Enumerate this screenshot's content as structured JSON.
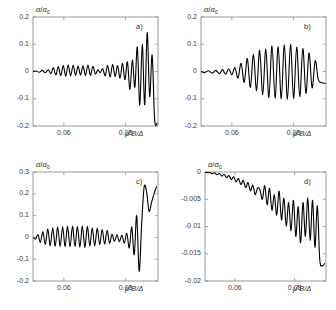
{
  "figure": {
    "title": "",
    "background": "#ffffff",
    "curve_color": "#000000",
    "axis_color": "#808080",
    "text_color": "#2b2b2b"
  },
  "chart_data": [
    {
      "type": "line",
      "panel": "a)",
      "title": "",
      "xlabel": "μ*B/Δ",
      "ylabel": "α/α0",
      "xlim": [
        0.05,
        0.0905
      ],
      "ylim": [
        -0.2,
        0.2
      ],
      "xticks": [
        0.06,
        0.08
      ],
      "xticklabels": [
        "0.06",
        "0.08"
      ],
      "yticks": [
        -0.2,
        -0.1,
        0,
        0.1,
        0.2
      ],
      "yticklabels": [
        "-0.2",
        "-0.1",
        "0",
        "0.1",
        "0.2"
      ],
      "grid": false,
      "legend": "none",
      "x": [
        0.05,
        0.051,
        0.052,
        0.053,
        0.054,
        0.055,
        0.0558,
        0.0566,
        0.0574,
        0.0582,
        0.059,
        0.0598,
        0.0606,
        0.0614,
        0.0622,
        0.063,
        0.0638,
        0.0646,
        0.0654,
        0.0662,
        0.067,
        0.0678,
        0.0686,
        0.0694,
        0.0702,
        0.071,
        0.0718,
        0.0726,
        0.0734,
        0.0742,
        0.075,
        0.0758,
        0.0766,
        0.0774,
        0.0782,
        0.079,
        0.0798,
        0.0806,
        0.0814,
        0.0822,
        0.083,
        0.0838,
        0.0846,
        0.0854,
        0.0862,
        0.087,
        0.0878,
        0.0886,
        0.0894,
        0.0902
      ],
      "y": [
        0.0,
        0.002,
        -0.003,
        0.004,
        -0.004,
        0.006,
        -0.008,
        0.014,
        -0.013,
        0.018,
        -0.015,
        0.022,
        -0.017,
        0.024,
        -0.016,
        0.023,
        -0.014,
        0.02,
        -0.013,
        0.021,
        -0.015,
        0.024,
        -0.014,
        0.019,
        -0.009,
        0.006,
        -0.004,
        0.01,
        -0.016,
        0.022,
        -0.02,
        0.026,
        -0.018,
        0.022,
        -0.024,
        0.03,
        -0.03,
        0.035,
        -0.066,
        0.042,
        -0.058,
        0.09,
        -0.124,
        0.1,
        -0.122,
        0.142,
        -0.092,
        0.06,
        -0.175,
        -0.19
      ]
    },
    {
      "type": "line",
      "panel": "b)",
      "title": "",
      "xlabel": "μ*B/Δ",
      "ylabel": "α/α0",
      "xlim": [
        0.05,
        0.0905
      ],
      "ylim": [
        -0.2,
        0.2
      ],
      "xticks": [
        0.06,
        0.08
      ],
      "xticklabels": [
        "0.06",
        "0.08"
      ],
      "yticks": [
        -0.2,
        -0.1,
        0,
        0.1,
        0.2
      ],
      "yticklabels": [
        "-0.2",
        "-0.1",
        "0",
        "0.1",
        "0.2"
      ],
      "grid": false,
      "legend": "none",
      "x": [
        0.05,
        0.0512,
        0.0524,
        0.0536,
        0.0548,
        0.056,
        0.057,
        0.058,
        0.059,
        0.06,
        0.061,
        0.062,
        0.063,
        0.064,
        0.065,
        0.066,
        0.067,
        0.068,
        0.069,
        0.07,
        0.071,
        0.072,
        0.073,
        0.074,
        0.075,
        0.076,
        0.077,
        0.078,
        0.079,
        0.08,
        0.081,
        0.082,
        0.083,
        0.084,
        0.085,
        0.086,
        0.087,
        0.088,
        0.089,
        0.0902
      ],
      "y": [
        0.0,
        -0.004,
        0.003,
        -0.006,
        0.004,
        -0.008,
        0.007,
        -0.01,
        0.01,
        -0.012,
        0.014,
        -0.024,
        0.03,
        -0.04,
        0.048,
        -0.058,
        0.062,
        -0.07,
        0.078,
        -0.085,
        0.082,
        -0.095,
        0.094,
        -0.098,
        0.092,
        -0.1,
        0.098,
        -0.102,
        0.1,
        -0.098,
        0.09,
        -0.092,
        0.084,
        -0.08,
        0.068,
        -0.06,
        0.04,
        -0.03,
        -0.04,
        -0.044
      ]
    },
    {
      "type": "line",
      "panel": "c)",
      "title": "",
      "xlabel": "μ*B/Δ",
      "ylabel": "α/α0",
      "xlim": [
        0.05,
        0.0905
      ],
      "ylim": [
        -0.2,
        0.3
      ],
      "xticks": [
        0.06,
        0.08
      ],
      "xticklabels": [
        "0.06",
        "0.08"
      ],
      "yticks": [
        -0.2,
        -0.1,
        0,
        0.1,
        0.2,
        0.3
      ],
      "yticklabels": [
        "-0.2",
        "-0.1",
        "0",
        "0.1",
        "0.2",
        "0.3"
      ],
      "grid": false,
      "legend": "none",
      "x": [
        0.05,
        0.0508,
        0.0516,
        0.0524,
        0.0532,
        0.054,
        0.0548,
        0.0556,
        0.0564,
        0.0572,
        0.058,
        0.0588,
        0.0596,
        0.0604,
        0.0612,
        0.062,
        0.0628,
        0.0636,
        0.0644,
        0.0652,
        0.066,
        0.0668,
        0.0676,
        0.0684,
        0.0692,
        0.07,
        0.0708,
        0.0716,
        0.0724,
        0.0732,
        0.074,
        0.0748,
        0.0756,
        0.0764,
        0.0772,
        0.078,
        0.0788,
        0.0796,
        0.0804,
        0.0812,
        0.082,
        0.0828,
        0.0836,
        0.0844,
        0.0852,
        0.086,
        0.0868,
        0.0876,
        0.0884,
        0.0892,
        0.09
      ],
      "y": [
        0.0,
        -0.008,
        0.012,
        -0.022,
        0.026,
        -0.032,
        0.038,
        -0.038,
        0.044,
        -0.04,
        0.048,
        -0.042,
        0.05,
        -0.042,
        0.052,
        -0.044,
        0.052,
        -0.042,
        0.05,
        -0.044,
        0.052,
        -0.046,
        0.05,
        -0.038,
        0.044,
        -0.04,
        0.042,
        -0.032,
        0.036,
        -0.03,
        0.032,
        -0.026,
        0.014,
        -0.018,
        0.012,
        -0.02,
        0.01,
        -0.026,
        0.018,
        -0.048,
        0.048,
        -0.08,
        0.1,
        -0.155,
        0.06,
        0.23,
        0.21,
        0.12,
        0.16,
        0.2,
        0.232
      ]
    },
    {
      "type": "line",
      "panel": "d)",
      "title": "",
      "xlabel": "μ*B/Δ",
      "ylabel": "α/α0",
      "xlim": [
        0.05,
        0.0905
      ],
      "ylim": [
        -0.02,
        0.0
      ],
      "xticks": [
        0.06,
        0.08
      ],
      "xticklabels": [
        "0.06",
        "0.08"
      ],
      "yticks": [
        -0.02,
        -0.015,
        -0.01,
        -0.005,
        0
      ],
      "yticklabels": [
        "-0.02",
        "-0.015",
        "-0.01",
        "-0.005",
        "0"
      ],
      "grid": false,
      "legend": "none",
      "x": [
        0.05,
        0.0508,
        0.0516,
        0.0524,
        0.0532,
        0.054,
        0.0548,
        0.0556,
        0.0564,
        0.0572,
        0.058,
        0.0588,
        0.0596,
        0.0604,
        0.0612,
        0.062,
        0.0628,
        0.0636,
        0.0644,
        0.0652,
        0.066,
        0.0668,
        0.0676,
        0.0684,
        0.0692,
        0.07,
        0.0708,
        0.0716,
        0.0724,
        0.0732,
        0.074,
        0.0748,
        0.0756,
        0.0764,
        0.0772,
        0.078,
        0.0788,
        0.0796,
        0.0804,
        0.0812,
        0.082,
        0.0828,
        0.0836,
        0.0844,
        0.0852,
        0.086,
        0.0868,
        0.0876,
        0.0884,
        0.0892,
        0.09
      ],
      "y": [
        -5e-05,
        -0.00015,
        -8e-05,
        -0.0003,
        -0.00015,
        -0.0005,
        -0.00028,
        -0.00075,
        -0.00045,
        -0.00105,
        -0.00065,
        -0.0014,
        -0.0009,
        -0.0018,
        -0.0012,
        -0.0023,
        -0.00155,
        -0.00285,
        -0.00195,
        -0.00345,
        -0.0024,
        -0.00415,
        -0.0029,
        -0.0033,
        -0.005,
        -0.0025,
        -0.006,
        -0.003,
        -0.007,
        -0.0042,
        -0.0079,
        -0.0035,
        -0.0088,
        -0.0048,
        -0.0099,
        -0.0056,
        -0.0108,
        -0.0052,
        -0.0118,
        -0.0064,
        -0.013,
        -0.0056,
        -0.0118,
        -0.0048,
        -0.0125,
        -0.0052,
        -0.0138,
        -0.0062,
        -0.016,
        -0.0172,
        -0.0168
      ]
    }
  ]
}
